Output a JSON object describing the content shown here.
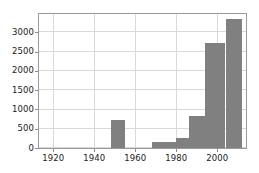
{
  "chart_data": {
    "type": "bar",
    "title": "",
    "subtitle": "",
    "xlabel": "",
    "ylabel": "",
    "grid": true,
    "legend": false,
    "legend_position": "none",
    "bar_color": "#808080",
    "background_color": "#ffffff",
    "axis_color": "#9a9a9a",
    "grid_color": "#d9d9d9",
    "xlim": [
      1913,
      2014
    ],
    "ylim": [
      0,
      3480
    ],
    "xticks": [
      1920,
      1940,
      1960,
      1980,
      2000
    ],
    "yticks": [
      0,
      500,
      1000,
      1500,
      2000,
      2500,
      3000
    ],
    "xtick_labels": [
      "1920",
      "1940",
      "1960",
      "1980",
      "2000"
    ],
    "ytick_labels": [
      "0",
      "500",
      "1000",
      "1500",
      "2000",
      "2500",
      "3000"
    ],
    "bin_width": 5,
    "bins": [
      {
        "start": 1913,
        "end": 1918,
        "value": 0
      },
      {
        "start": 1918,
        "end": 1923,
        "value": 0
      },
      {
        "start": 1923,
        "end": 1928,
        "value": 0
      },
      {
        "start": 1928,
        "end": 1933,
        "value": 0
      },
      {
        "start": 1933,
        "end": 1938,
        "value": 0
      },
      {
        "start": 1938,
        "end": 1943,
        "value": 0
      },
      {
        "start": 1943,
        "end": 1948,
        "value": 0
      },
      {
        "start": 1948,
        "end": 1955,
        "value": 730
      },
      {
        "start": 1955,
        "end": 1960,
        "value": 0
      },
      {
        "start": 1960,
        "end": 1965,
        "value": 0
      },
      {
        "start": 1965,
        "end": 1968,
        "value": 0
      },
      {
        "start": 1968,
        "end": 1975,
        "value": 150
      },
      {
        "start": 1975,
        "end": 1980,
        "value": 150
      },
      {
        "start": 1980,
        "end": 1986,
        "value": 250
      },
      {
        "start": 1986,
        "end": 1994,
        "value": 830
      },
      {
        "start": 1994,
        "end": 2004,
        "value": 2730
      },
      {
        "start": 2004,
        "end": 2012,
        "value": 3350
      },
      {
        "start": 2012,
        "end": 2014,
        "value": 0
      }
    ],
    "categories": [
      "1948-1955",
      "1968-1975",
      "1975-1980",
      "1980-1986",
      "1986-1994",
      "1994-2004",
      "2004-2012"
    ],
    "values": [
      730,
      150,
      150,
      250,
      830,
      2730,
      3350
    ]
  }
}
